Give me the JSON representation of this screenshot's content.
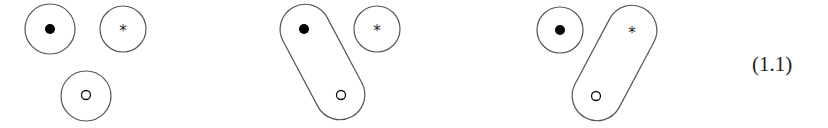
{
  "figure": {
    "equation_label": "(1.1)",
    "marker_star": "*",
    "panels": [
      {
        "name": "separate",
        "description": "three separate circles: filled dot, star, open dot"
      },
      {
        "name": "filled-open-paired",
        "description": "filled dot and open dot enclosed in one capsule; star separate"
      },
      {
        "name": "star-open-paired",
        "description": "star and open dot enclosed in one capsule; filled dot separate"
      }
    ]
  }
}
